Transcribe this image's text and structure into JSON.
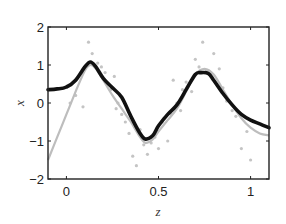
{
  "chart_data": {
    "type": "line",
    "title": "",
    "xlabel": "z",
    "ylabel": "x",
    "xlim": [
      -0.1,
      1.1
    ],
    "ylim": [
      -2,
      2
    ],
    "xticks": [
      0,
      0.5,
      1
    ],
    "xtick_labels": [
      "0",
      "0.5",
      "1"
    ],
    "yticks": [
      -2,
      -1,
      0,
      1,
      2
    ],
    "ytick_labels": [
      "-2",
      "-1",
      "0",
      "1",
      "2"
    ],
    "grid": false,
    "legend": null,
    "series": [
      {
        "name": "estimate",
        "style": "thick-black-line",
        "color": "#111111",
        "x": [
          -0.1,
          -0.05,
          0.0,
          0.05,
          0.1,
          0.13,
          0.16,
          0.2,
          0.25,
          0.3,
          0.35,
          0.4,
          0.43,
          0.47,
          0.5,
          0.55,
          0.6,
          0.65,
          0.7,
          0.73,
          0.77,
          0.8,
          0.85,
          0.9,
          0.95,
          1.0,
          1.05,
          1.1
        ],
        "y": [
          0.35,
          0.37,
          0.42,
          0.6,
          0.95,
          1.08,
          0.95,
          0.65,
          0.4,
          0.15,
          -0.35,
          -0.8,
          -0.95,
          -0.85,
          -0.6,
          -0.3,
          -0.05,
          0.35,
          0.75,
          0.8,
          0.78,
          0.6,
          0.25,
          -0.05,
          -0.3,
          -0.45,
          -0.55,
          -0.65
        ]
      },
      {
        "name": "true function",
        "style": "thin-gray-line",
        "color": "#bbbbbb",
        "x": [
          -0.1,
          -0.05,
          0.0,
          0.05,
          0.1,
          0.13,
          0.16,
          0.2,
          0.25,
          0.3,
          0.35,
          0.4,
          0.43,
          0.47,
          0.5,
          0.55,
          0.6,
          0.65,
          0.7,
          0.75,
          0.8,
          0.85,
          0.9,
          0.95,
          1.0,
          1.05,
          1.1
        ],
        "y": [
          -1.5,
          -0.9,
          -0.3,
          0.3,
          0.85,
          1.0,
          0.9,
          0.6,
          0.2,
          -0.15,
          -0.5,
          -0.9,
          -1.05,
          -0.95,
          -0.75,
          -0.45,
          -0.15,
          0.3,
          0.75,
          0.9,
          0.75,
          0.35,
          -0.05,
          -0.4,
          -0.65,
          -0.8,
          -0.85
        ]
      },
      {
        "name": "observations",
        "style": "gray-scatter",
        "color": "#c4c4c4",
        "x": [
          0.05,
          0.08,
          0.12,
          0.14,
          0.17,
          0.19,
          0.21,
          0.23,
          0.24,
          0.27,
          0.28,
          0.3,
          0.32,
          0.34,
          0.36,
          0.38,
          0.4,
          0.42,
          0.44,
          0.46,
          0.48,
          0.5,
          0.52,
          0.53,
          0.55,
          0.57,
          0.6,
          0.62,
          0.63,
          0.65,
          0.68,
          0.7,
          0.72,
          0.74,
          0.76,
          0.8,
          0.83,
          0.85,
          0.87,
          0.9,
          0.92,
          0.95,
          0.98,
          1.0,
          0.02,
          0.09,
          0.26,
          0.58
        ],
        "y": [
          0.2,
          0.8,
          1.6,
          1.3,
          1.05,
          0.95,
          0.8,
          0.5,
          0.35,
          -0.15,
          0.0,
          -0.3,
          -0.5,
          -0.8,
          -1.4,
          -1.65,
          -0.7,
          -1.1,
          -1.35,
          -1.05,
          -0.9,
          -1.2,
          -0.5,
          -0.4,
          -1.0,
          -0.3,
          0.0,
          -0.2,
          0.35,
          0.55,
          0.3,
          1.15,
          0.95,
          1.6,
          0.85,
          1.3,
          0.9,
          0.4,
          0.05,
          -0.2,
          -0.35,
          -1.2,
          -0.75,
          -1.5,
          0.0,
          -0.1,
          0.7,
          0.6
        ]
      }
    ]
  }
}
